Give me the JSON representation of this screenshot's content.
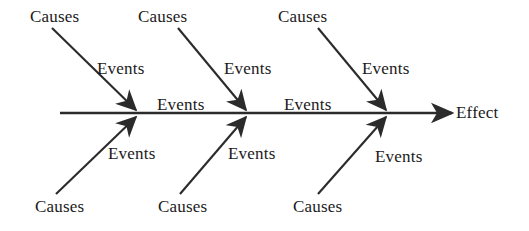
{
  "diagram": {
    "type": "fishbone-ishikawa",
    "colors": {
      "line": "#2b2b2b",
      "text": "#1a1a1a",
      "background": "#ffffff"
    },
    "spine": {
      "label": "Effect",
      "start_x": 60,
      "end_x": 452,
      "y": 113,
      "arrow_label_x": 456,
      "arrow_label_y": 104
    },
    "spine_labels": [
      {
        "text": "Events",
        "x": 157,
        "y": 96
      },
      {
        "text": "Events",
        "x": 284,
        "y": 96
      }
    ],
    "top_branches": [
      {
        "cause_label": "Causes",
        "cause_x": 30,
        "cause_y": 8,
        "event_label": "Events",
        "event_x": 97,
        "event_y": 60,
        "line": {
          "x1": 52,
          "y1": 28,
          "x2": 136,
          "y2": 110
        }
      },
      {
        "cause_label": "Causes",
        "cause_x": 138,
        "cause_y": 8,
        "event_label": "Events",
        "event_x": 224,
        "event_y": 60,
        "line": {
          "x1": 178,
          "y1": 28,
          "x2": 246,
          "y2": 110
        }
      },
      {
        "cause_label": "Causes",
        "cause_x": 278,
        "cause_y": 8,
        "event_label": "Events",
        "event_x": 362,
        "event_y": 60,
        "line": {
          "x1": 318,
          "y1": 28,
          "x2": 386,
          "y2": 110
        }
      }
    ],
    "bottom_branches": [
      {
        "cause_label": "Causes",
        "cause_x": 35,
        "cause_y": 198,
        "event_label": "Events",
        "event_x": 108,
        "event_y": 145,
        "line": {
          "x1": 56,
          "y1": 194,
          "x2": 136,
          "y2": 117
        }
      },
      {
        "cause_label": "Causes",
        "cause_x": 158,
        "cause_y": 198,
        "event_label": "Events",
        "event_x": 228,
        "event_y": 145,
        "line": {
          "x1": 180,
          "y1": 194,
          "x2": 246,
          "y2": 117
        }
      },
      {
        "cause_label": "Causes",
        "cause_x": 293,
        "cause_y": 198,
        "event_label": "Events",
        "event_x": 375,
        "event_y": 148,
        "line": {
          "x1": 318,
          "y1": 194,
          "x2": 386,
          "y2": 117
        }
      }
    ]
  }
}
